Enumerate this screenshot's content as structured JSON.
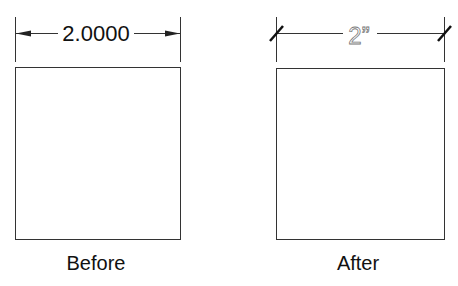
{
  "before": {
    "dimension_text": "2.0000",
    "terminator": "arrow",
    "caption": "Before"
  },
  "after": {
    "dimension_text": "2”",
    "terminator": "oblique-tick",
    "caption": "After"
  },
  "colors": {
    "line": "#333333",
    "text": "#111111",
    "after_text": "#777777"
  }
}
